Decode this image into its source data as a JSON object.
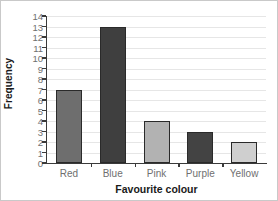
{
  "chart_data": {
    "type": "bar",
    "title": "",
    "xlabel": "Favourite colour",
    "ylabel": "Frequency",
    "categories": [
      "Red",
      "Blue",
      "Pink",
      "Purple",
      "Yellow"
    ],
    "values": [
      7,
      13,
      4,
      3,
      2
    ],
    "ylim": [
      0,
      14
    ],
    "ytick_step": 1,
    "yticks": [
      14,
      13,
      12,
      11,
      10,
      9,
      8,
      7,
      6,
      5,
      4,
      3,
      2,
      1,
      0
    ],
    "grid": true,
    "grid_axis": "y",
    "legend": false,
    "bar_colors": [
      "#6e6e6e",
      "#3f3f3f",
      "#b2b2b2",
      "#434343",
      "#cfcfcf"
    ],
    "bar_edge_color": "#2a2a2a",
    "axis_color": "#3a3a3a",
    "gridline_color": "#e6e6e6",
    "tick_label_color": "#6f6f6f",
    "axis_title_color": "#1a1a1a",
    "background_color": "#ffffff",
    "border_color": "#c9c9c9"
  }
}
